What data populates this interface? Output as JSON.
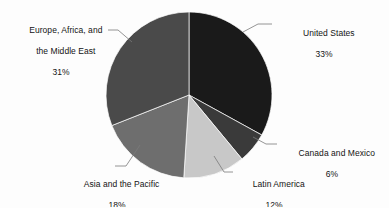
{
  "chart_data": {
    "type": "pie",
    "title": "",
    "subtitle": "",
    "xlabel": "",
    "ylabel": "",
    "legend_position": "none",
    "grid": false,
    "labels_position": "outside-with-leader-lines",
    "start_angle_deg": 0,
    "direction": "clockwise",
    "categories": [
      "United States",
      "Canada and Mexico",
      "Latin America",
      "Asia and the Pacific",
      "Europe, Africa, and the Middle East"
    ],
    "values": [
      33,
      6,
      12,
      18,
      31
    ],
    "value_labels": [
      "33%",
      "6%",
      "12%",
      "18%",
      "31%"
    ],
    "units": "percent",
    "total": 100,
    "slices": [
      {
        "name": "United States",
        "label_line1": "United States",
        "label_line2": "",
        "percent_text": "33%",
        "value": 33,
        "color": "#1a1a1a",
        "start_deg": 0,
        "end_deg": 118.8
      },
      {
        "name": "Canada and Mexico",
        "label_line1": "Canada and Mexico",
        "label_line2": "",
        "percent_text": "6%",
        "value": 6,
        "color": "#3a3a3a",
        "start_deg": 118.8,
        "end_deg": 140.4
      },
      {
        "name": "Latin America",
        "label_line1": "Latin America",
        "label_line2": "",
        "percent_text": "12%",
        "value": 12,
        "color": "#c8c8c8",
        "start_deg": 140.4,
        "end_deg": 183.6
      },
      {
        "name": "Asia and the Pacific",
        "label_line1": "Asia and the Pacific",
        "label_line2": "",
        "percent_text": "18%",
        "value": 18,
        "color": "#6e6e6e",
        "start_deg": 183.6,
        "end_deg": 248.4
      },
      {
        "name": "Europe, Africa, and the Middle East",
        "label_line1": "Europe, Africa, and",
        "label_line2": "the Middle East",
        "percent_text": "31%",
        "value": 31,
        "color": "#4a4a4a",
        "start_deg": 248.4,
        "end_deg": 360
      }
    ],
    "background_color": "#fdfdfd",
    "text_color": "#141414",
    "leader_line_color": "#7a7a7a"
  }
}
